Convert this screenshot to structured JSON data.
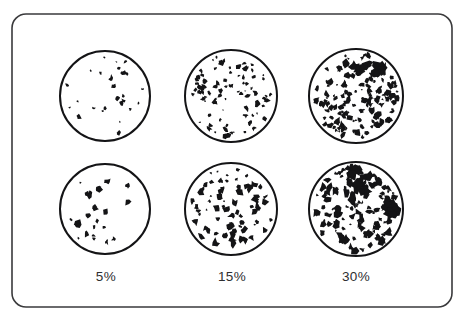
{
  "figure": {
    "title": "",
    "frame": {
      "x": 12,
      "y": 14,
      "width": 440,
      "height": 293,
      "corner_radius": 14,
      "stroke_color": "#3a3a3c",
      "stroke_width": 1.6,
      "fill_color": "#ffffff"
    },
    "background_color": "#ffffff",
    "ink_color": "#141416"
  },
  "chart_data": {
    "type": "diagram",
    "subtype": "percentage-coverage-comparison-chart",
    "title": "",
    "xlabel": "",
    "ylabel": "",
    "categories": [
      "5%",
      "15%",
      "30%"
    ],
    "values": [
      5,
      15,
      30
    ],
    "units": "percent area coverage",
    "rows": 2,
    "columns": 3,
    "legend": "none",
    "grid": false,
    "annotations": [],
    "circles": [
      {
        "id": "circle-r0-c0",
        "row": 0,
        "column": 0,
        "coverage_label": "5%",
        "coverage_percent": 5,
        "center_x": 105,
        "center_y": 96,
        "radius": 45,
        "speckle_count": 26,
        "speckle_scale": 1.0,
        "seed": 11
      },
      {
        "id": "circle-r0-c1",
        "row": 0,
        "column": 1,
        "coverage_label": "15%",
        "coverage_percent": 15,
        "center_x": 231,
        "center_y": 96,
        "radius": 46,
        "speckle_count": 92,
        "speckle_scale": 0.95,
        "seed": 23
      },
      {
        "id": "circle-r0-c2",
        "row": 0,
        "column": 2,
        "coverage_label": "30%",
        "coverage_percent": 30,
        "center_x": 356,
        "center_y": 96,
        "radius": 47,
        "speckle_count": 150,
        "speckle_scale": 1.15,
        "seed": 37
      },
      {
        "id": "circle-r1-c0",
        "row": 1,
        "column": 0,
        "coverage_label": "5%",
        "coverage_percent": 5,
        "center_x": 105,
        "center_y": 209,
        "radius": 45,
        "speckle_count": 24,
        "speckle_scale": 1.05,
        "seed": 53
      },
      {
        "id": "circle-r1-c1",
        "row": 1,
        "column": 1,
        "coverage_label": "15%",
        "coverage_percent": 15,
        "center_x": 231,
        "center_y": 209,
        "radius": 46,
        "speckle_count": 78,
        "speckle_scale": 1.2,
        "seed": 67
      },
      {
        "id": "circle-r1-c2",
        "row": 1,
        "column": 2,
        "coverage_label": "30%",
        "coverage_percent": 30,
        "center_x": 356,
        "center_y": 209,
        "radius": 47,
        "speckle_count": 132,
        "speckle_scale": 1.35,
        "seed": 89
      }
    ],
    "circle_outline": {
      "stroke_color": "#141416",
      "stroke_width": 2.0,
      "fill_color": "#ffffff"
    }
  },
  "labels": {
    "col_0": "5%",
    "col_1": "15%",
    "col_2": "30%"
  }
}
